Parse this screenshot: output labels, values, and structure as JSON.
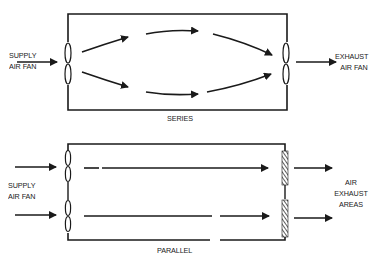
{
  "series": {
    "label": "SERIES",
    "supply_label_line1": "SUPPLY",
    "supply_label_line2": "AIR FAN",
    "exhaust_label_line1": "EXHAUST",
    "exhaust_label_line2": "AIR FAN"
  },
  "parallel": {
    "label": "PARALLEL",
    "supply_label_line1": "SUPPLY",
    "supply_label_line2": "AIR FAN",
    "exhaust_label_line1": "AIR",
    "exhaust_label_line2": "EXHAUST",
    "exhaust_label_line3": "AREAS"
  },
  "colors": {
    "ink": "#1a1a1a",
    "background": "#ffffff"
  }
}
